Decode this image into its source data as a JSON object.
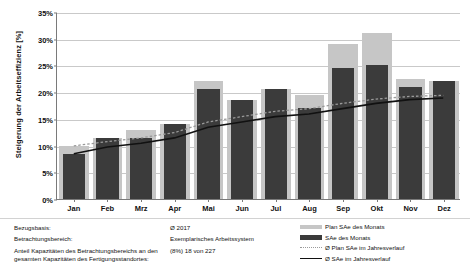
{
  "chart_data": {
    "type": "bar",
    "title": "",
    "xlabel": "",
    "ylabel": "Steigerung der Arbeitseffizienz [%]",
    "ylim": [
      0,
      35
    ],
    "ytick_step": 5,
    "grid": true,
    "legend_position": "bottom-right",
    "categories": [
      "Jan",
      "Feb",
      "Mrz",
      "Apr",
      "Mai",
      "Jun",
      "Jul",
      "Aug",
      "Sep",
      "Okt",
      "Nov",
      "Dez"
    ],
    "ytick_labels": [
      "0%",
      "5%",
      "10%",
      "15%",
      "20%",
      "25%",
      "30%",
      "35%"
    ],
    "series": [
      {
        "name": "Plan SAe des Monats",
        "type": "bar",
        "color": "#c6c6c6",
        "values": [
          10.0,
          11.5,
          13.0,
          14.0,
          22.0,
          18.5,
          20.5,
          19.5,
          29.0,
          31.0,
          22.5,
          22.0
        ]
      },
      {
        "name": "SAe des Monats",
        "type": "bar",
        "color": "#3b3b3b",
        "values": [
          8.5,
          11.5,
          11.5,
          14.0,
          20.5,
          18.5,
          20.5,
          17.0,
          24.5,
          25.0,
          21.0,
          22.0
        ]
      },
      {
        "name": "Ø Plan SAe im Jahresverlauf",
        "type": "line",
        "style": "dotted",
        "color": "#9a9a9a",
        "values": [
          10.0,
          10.8,
          11.5,
          12.5,
          14.5,
          15.5,
          16.5,
          17.0,
          18.0,
          18.8,
          19.3,
          19.5
        ]
      },
      {
        "name": "Ø SAe im Jahresverlauf",
        "type": "line",
        "style": "solid",
        "color": "#111111",
        "values": [
          8.5,
          9.8,
          10.5,
          11.5,
          13.5,
          14.5,
          15.5,
          16.0,
          17.0,
          18.0,
          18.7,
          19.0
        ]
      }
    ]
  },
  "legend": {
    "items": [
      {
        "label": "Plan SAe des Monats",
        "key": "swatch-plan"
      },
      {
        "label": "SAe des Monats",
        "key": "swatch-ist"
      },
      {
        "label": "Ø Plan SAe im Jahresverlauf",
        "key": "swatch-line-dotted"
      },
      {
        "label": "Ø SAe im Jahresverlauf",
        "key": "swatch-line-solid"
      }
    ]
  },
  "info": {
    "rows": [
      {
        "label": "Bezugsbasis:",
        "value": "Ø 2017"
      },
      {
        "label": "Betrachtungsbereich:",
        "value": "Exemplarisches Arbeitssystem"
      },
      {
        "label": "Anteil Kapazitäten des Betrachtungsbereichs an den gesamten Kapazitäten des Fertigungsstandortes:",
        "value": "(8%) 18 von 227"
      }
    ]
  }
}
